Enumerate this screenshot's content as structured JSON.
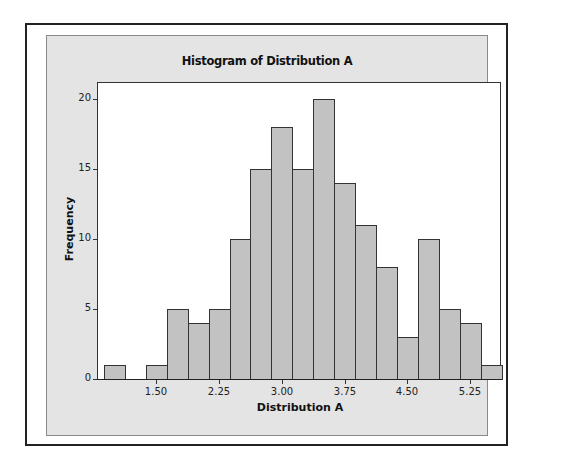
{
  "chart_data": {
    "type": "bar",
    "title": "Histogram of Distribution A",
    "xlabel": "Distribution A",
    "ylabel": "Frequency",
    "bin_width": 0.25,
    "bin_centers": [
      1.0,
      1.25,
      1.5,
      1.75,
      2.0,
      2.25,
      2.5,
      2.75,
      3.0,
      3.25,
      3.5,
      3.75,
      4.0,
      4.25,
      4.5,
      4.75,
      5.0,
      5.25,
      5.5
    ],
    "values": [
      1,
      0,
      1,
      5,
      4,
      5,
      10,
      15,
      18,
      15,
      20,
      14,
      11,
      8,
      3,
      10,
      5,
      4,
      1
    ],
    "x_ticks": [
      "1.50",
      "2.25",
      "3.00",
      "3.75",
      "4.50",
      "5.25"
    ],
    "x_tick_values": [
      1.5,
      2.25,
      3.0,
      3.75,
      4.5,
      5.25
    ],
    "y_ticks": [
      "0",
      "5",
      "10",
      "15",
      "20"
    ],
    "y_tick_values": [
      0,
      5,
      10,
      15,
      20
    ],
    "xlim": [
      0.79,
      5.62
    ],
    "ylim": [
      0,
      21.2
    ],
    "grid": false,
    "legend": null,
    "colors": {
      "bar_fill": "#c2c2c2",
      "bar_edge": "#333333",
      "panel": "#e4e4e4",
      "plot_bg": "#ffffff"
    }
  }
}
